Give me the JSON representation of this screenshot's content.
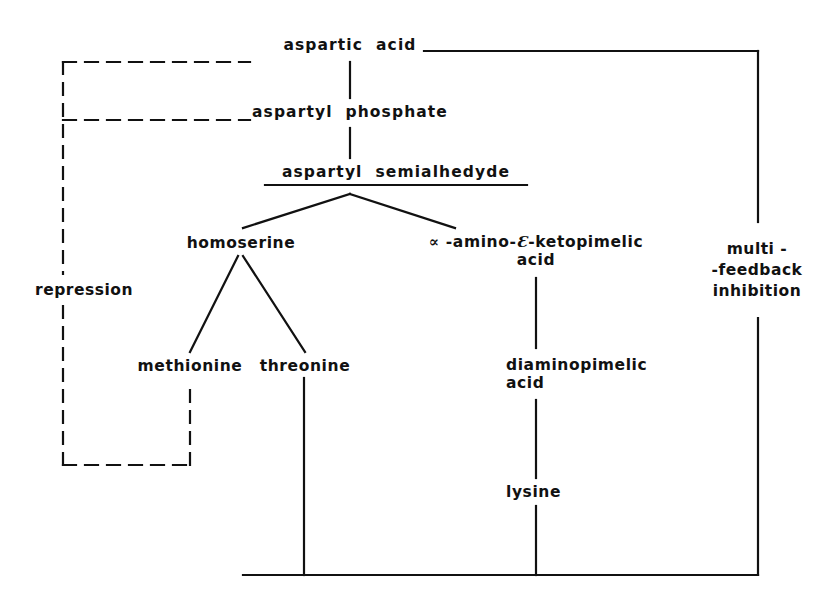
{
  "diagram": {
    "background": "#ffffff",
    "ink": "#111111",
    "nodes": {
      "aspartic_acid": "aspartic  acid",
      "aspartyl_phosphate": "aspartyl  phosphate",
      "aspartyl_semialdehyde": "aspartyl  semialhedyde",
      "homoserine": "homoserine",
      "ketopimelic_line1_prefix": "∝",
      "ketopimelic_line1_mid": " -amino-",
      "ketopimelic_line1_eps": "Ɛ",
      "ketopimelic_line1_suffix": "-ketopimelic",
      "ketopimelic_line2": "acid",
      "methionine": "methionine",
      "threonine": "threonine",
      "diaminopimelic_line1": "diaminopimelic",
      "diaminopimelic_line2": "acid",
      "lysine": "lysine"
    },
    "annotations": {
      "repression": "repression",
      "multi_feedback_line1": "multi -",
      "multi_feedback_line2": "-feedback",
      "multi_feedback_line3": "inhibition"
    }
  }
}
